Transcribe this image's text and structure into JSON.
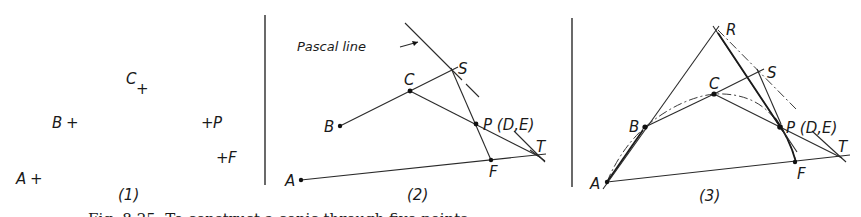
{
  "figure": {
    "caption_partial": "Fig. 8.25. To construct a conic through five points...",
    "panels": [
      {
        "id": "1",
        "label": "(1)",
        "points": {
          "A": "A",
          "B": "B",
          "C": "C",
          "P": "P",
          "F": "F"
        },
        "marker": "+"
      },
      {
        "id": "2",
        "label": "(2)",
        "points": {
          "A": "A",
          "B": "B",
          "C": "C",
          "S": "S",
          "P": "P (D,E)",
          "F": "F",
          "T": "T"
        },
        "annotation": "Pascal line"
      },
      {
        "id": "3",
        "label": "(3)",
        "points": {
          "A": "A",
          "B": "B",
          "C": "C",
          "R": "R",
          "S": "S",
          "P": "P (D,E)",
          "F": "F",
          "T": "T"
        }
      }
    ]
  }
}
